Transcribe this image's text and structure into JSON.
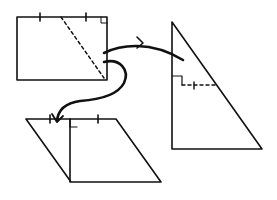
{
  "diagram": {
    "stroke_color": "#111111",
    "background": "#ffffff",
    "shapes": {
      "rectangle": {
        "corners": [
          [
            17,
            17
          ],
          [
            107,
            17
          ],
          [
            107,
            80
          ],
          [
            17,
            80
          ]
        ],
        "tick_marks_top_x": [
          40,
          86
        ],
        "right_angle_corner": "top-right",
        "dashed_diagonal": [
          [
            61,
            17
          ],
          [
            104,
            78
          ]
        ]
      },
      "triangle": {
        "vertices": [
          [
            172,
            22
          ],
          [
            172,
            149
          ],
          [
            262,
            149
          ]
        ],
        "right_angle_marker_at": [
          172,
          85
        ],
        "dashed_midline": [
          [
            172,
            85
          ],
          [
            218,
            85
          ]
        ],
        "tick_on_midline_x": 194
      },
      "parallelogram": {
        "vertices": [
          [
            26,
            119
          ],
          [
            116,
            119
          ],
          [
            161,
            182
          ],
          [
            71,
            182
          ]
        ],
        "height_line": [
          [
            70,
            119
          ],
          [
            70,
            182
          ]
        ],
        "right_angle_marker_at": [
          70,
          119
        ],
        "tick_marks_top_x": [
          50,
          98
        ]
      }
    },
    "arrows": [
      {
        "name": "rectangle-to-triangle",
        "from": [
          104,
          52
        ],
        "to": [
          183,
          60
        ]
      },
      {
        "name": "rectangle-to-parallelogram",
        "from": [
          104,
          62
        ],
        "to": [
          57,
          121
        ]
      }
    ]
  }
}
